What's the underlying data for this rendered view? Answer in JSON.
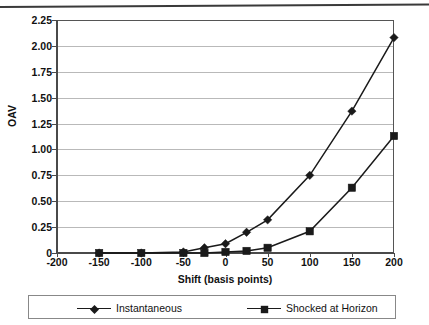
{
  "chart_data": {
    "type": "line",
    "title": "",
    "xlabel": "Shift (basis points)",
    "ylabel": "OAV",
    "x": [
      -150,
      -100,
      -50,
      -25,
      0,
      25,
      50,
      100,
      150,
      200
    ],
    "xlim": [
      -200,
      200
    ],
    "ylim": [
      0,
      2.25
    ],
    "grid": true,
    "legend_position": "bottom",
    "xticks": [
      "-200",
      "-150",
      "-100",
      "-50",
      "0",
      "50",
      "100",
      "150",
      "200"
    ],
    "xtick_values": [
      -200,
      -150,
      -100,
      -50,
      0,
      50,
      100,
      150,
      200
    ],
    "yticks": [
      "0",
      "0.25",
      "0.50",
      "0.75",
      "1.00",
      "1.25",
      "1.50",
      "1.75",
      "2.00",
      "2.25"
    ],
    "ytick_values": [
      0,
      0.25,
      0.5,
      0.75,
      1.0,
      1.25,
      1.5,
      1.75,
      2.0,
      2.25
    ],
    "series": [
      {
        "name": "Instantaneous",
        "marker": "diamond",
        "color": "#1a1a1a",
        "values": [
          0.0,
          0.0,
          0.01,
          0.05,
          0.09,
          0.2,
          0.32,
          0.75,
          1.37,
          2.08
        ]
      },
      {
        "name": "Shocked at Horizon",
        "marker": "square",
        "color": "#1a1a1a",
        "values": [
          0.0,
          0.0,
          0.0,
          0.0,
          0.01,
          0.02,
          0.05,
          0.21,
          0.63,
          1.13
        ]
      }
    ]
  },
  "legend": {
    "items": [
      {
        "label": "Instantaneous"
      },
      {
        "label": "Shocked at Horizon"
      }
    ]
  },
  "axes": {
    "y_title": "OAV",
    "x_title": "Shift (basis points)"
  }
}
